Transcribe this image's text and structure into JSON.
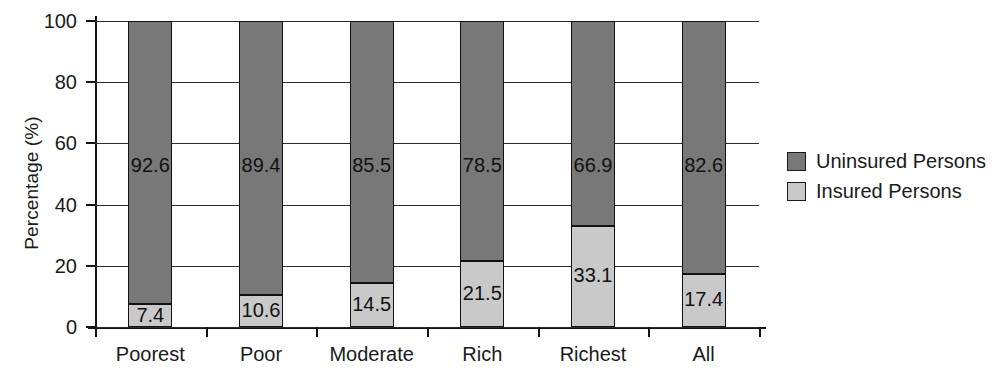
{
  "chart_data": {
    "type": "bar",
    "subtype": "stacked-100",
    "title": "",
    "xlabel": "",
    "ylabel": "Percentage (%)",
    "ylim": [
      0,
      100
    ],
    "yticks": [
      0,
      20,
      40,
      60,
      80,
      100
    ],
    "ytick_labels": [
      "0",
      "20",
      "40",
      "60",
      "80",
      "100"
    ],
    "grid": true,
    "grid_axis": "y",
    "legend_position": "right",
    "categories": [
      "Poorest",
      "Poor",
      "Moderate",
      "Rich",
      "Richest",
      "All"
    ],
    "series": [
      {
        "name": "Insured Persons",
        "color": "#c9c9c9",
        "values": [
          7.4,
          10.6,
          14.5,
          21.5,
          33.1,
          17.4
        ],
        "labels": [
          "7.4",
          "10.6",
          "14.5",
          "21.5",
          "33.1",
          "17.4"
        ]
      },
      {
        "name": "Uninsured Persons",
        "color": "#787878",
        "values": [
          92.6,
          89.4,
          85.5,
          78.5,
          66.9,
          82.6
        ],
        "labels": [
          "92.6",
          "89.4",
          "85.5",
          "78.5",
          "66.9",
          "82.6"
        ]
      }
    ],
    "legend_entries": [
      {
        "label": "Uninsured Persons",
        "color": "#787878",
        "swatch": "dark"
      },
      {
        "label": "Insured Persons",
        "color": "#c9c9c9",
        "swatch": "light"
      }
    ]
  },
  "colors": {
    "uninsured": "#787878",
    "insured": "#c9c9c9",
    "axis": "#141414",
    "grid": "#2c2c2c",
    "text": "#1a1a1a",
    "background": "#ffffff"
  }
}
